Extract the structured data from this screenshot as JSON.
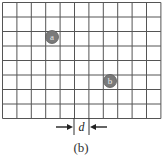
{
  "figure": {
    "caption": "(b)",
    "grid": {
      "columns": 11,
      "rows": 8,
      "left": 2.5,
      "top": 2.5,
      "cell_width": 14.4,
      "cell_height": 14.5,
      "line_color": "#555555"
    },
    "markers": [
      {
        "label": "a",
        "cx": 52,
        "cy": 37,
        "r": 6.5,
        "fill": "#7a7a7a",
        "text_color": "#e8e8e8"
      },
      {
        "label": "b",
        "cx": 110,
        "cy": 81,
        "r": 6.5,
        "fill": "#7a7a7a",
        "text_color": "#e8e8e8"
      }
    ],
    "dimension": {
      "label": "d",
      "x1": 74,
      "x2": 89,
      "tick_top": 118,
      "tick_bottom": 135,
      "arrow_y": 127
    }
  }
}
